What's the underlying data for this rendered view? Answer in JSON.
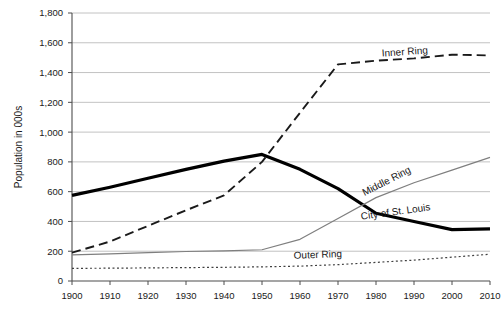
{
  "chart_data": {
    "type": "line",
    "title": "",
    "xlabel": "",
    "ylabel": "Population in 000s",
    "x": [
      1900,
      1910,
      1920,
      1930,
      1940,
      1950,
      1960,
      1970,
      1980,
      1990,
      2000,
      2010
    ],
    "categories": [
      "1900",
      "1910",
      "1920",
      "1930",
      "1940",
      "1950",
      "1960",
      "1970",
      "1980",
      "1990",
      "2000",
      "2010"
    ],
    "xlim": [
      1900,
      2010
    ],
    "ylim": [
      0,
      1800
    ],
    "y_ticks": [
      0,
      200,
      400,
      600,
      800,
      1000,
      1200,
      1400,
      1600,
      1800
    ],
    "y_tick_labels": [
      "0",
      "200",
      "400",
      "600",
      "800",
      "1,000",
      "1,200",
      "1,400",
      "1,600",
      "1,800"
    ],
    "grid": "horizontal",
    "legend_position": "inline-annotations",
    "series": [
      {
        "name": "City of St. Louis",
        "label": "City of St. Louis",
        "style": "solid-thick",
        "color": "#000000",
        "width": 3.2,
        "values": [
          575,
          630,
          690,
          750,
          805,
          850,
          750,
          620,
          455,
          400,
          345,
          350
        ]
      },
      {
        "name": "Inner Ring",
        "label": "Inner Ring",
        "style": "dashed-long",
        "color": "#1a1a1a",
        "width": 1.9,
        "values": [
          190,
          265,
          370,
          475,
          575,
          800,
          1130,
          1455,
          1480,
          1495,
          1520,
          1515
        ]
      },
      {
        "name": "Middle Ring",
        "label": "Middle Ring",
        "style": "solid-thin",
        "color": "#7f7f7f",
        "width": 1.2,
        "values": [
          175,
          182,
          190,
          198,
          203,
          210,
          280,
          420,
          560,
          660,
          745,
          830
        ]
      },
      {
        "name": "Outer Ring",
        "label": "Outer Ring",
        "style": "dotted",
        "color": "#404040",
        "width": 1.2,
        "values": [
          85,
          86,
          88,
          90,
          92,
          95,
          100,
          110,
          125,
          140,
          160,
          180
        ]
      }
    ],
    "annotations": [
      {
        "text": "Inner Ring",
        "for": "Inner Ring",
        "x": 405,
        "y": 55,
        "rotate": -4
      },
      {
        "text": "Middle Ring",
        "for": "Middle Ring",
        "x": 388,
        "y": 184,
        "rotate": -27
      },
      {
        "text": "City of St. Louis",
        "for": "City of St. Louis",
        "x": 396,
        "y": 215,
        "rotate": -8
      },
      {
        "text": "Outer Ring",
        "for": "Outer Ring",
        "x": 318,
        "y": 258,
        "rotate": -2
      }
    ]
  },
  "colors": {
    "background": "#ffffff",
    "gridline": "#b3b3b3",
    "axis": "#4d4d4d",
    "text": "#1a1a1a"
  }
}
